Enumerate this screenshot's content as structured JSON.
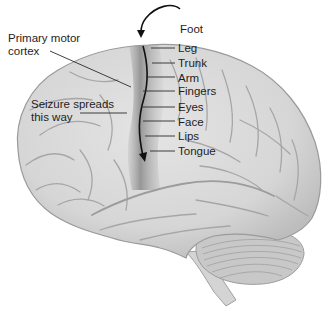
{
  "figure": {
    "colors": {
      "brain_fill": "#d8d8d8",
      "brain_outline": "#9a9a9a",
      "sulcus": "#a8a8a8",
      "motor_strip": "#8e8e8e",
      "cerebellum": "#c2c2c2",
      "arrow": "#111111",
      "text": "#1e1e1e"
    }
  },
  "labels": {
    "left": [
      {
        "id": "primary-motor-cortex",
        "text_line1": "Primary motor",
        "text_line2": "cortex"
      },
      {
        "id": "seizure-spreads",
        "text_line1": "Seizure spreads",
        "text_line2": "this way"
      }
    ],
    "homunculus": [
      {
        "id": "foot",
        "text": "Foot"
      },
      {
        "id": "leg",
        "text": "Leg"
      },
      {
        "id": "trunk",
        "text": "Trunk"
      },
      {
        "id": "arm",
        "text": "Arm"
      },
      {
        "id": "fingers",
        "text": "Fingers"
      },
      {
        "id": "eyes",
        "text": "Eyes"
      },
      {
        "id": "face",
        "text": "Face"
      },
      {
        "id": "lips",
        "text": "Lips"
      },
      {
        "id": "tongue",
        "text": "Tongue"
      }
    ]
  }
}
